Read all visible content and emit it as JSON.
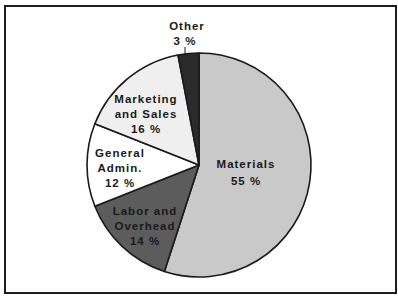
{
  "chart_data": {
    "type": "pie",
    "title": "",
    "start_angle": "12 o'clock, clockwise",
    "slices": [
      {
        "label": "Materials",
        "value": 55,
        "display": "55%",
        "color": "#c9c9c9"
      },
      {
        "label": "Labor and Overhead",
        "value": 14,
        "display": "14%",
        "color": "#5c5c5c"
      },
      {
        "label": "General Admin.",
        "value": 12,
        "display": "12%",
        "color": "#ffffff"
      },
      {
        "label": "Marketing and Sales",
        "value": 16,
        "display": "16%",
        "color": "#efefef"
      },
      {
        "label": "Other",
        "value": 3,
        "display": "3%",
        "color": "#2b2b2b"
      }
    ],
    "categories": [
      "Materials",
      "Labor and Overhead",
      "General Admin.",
      "Marketing and Sales",
      "Other"
    ],
    "values": [
      55,
      14,
      12,
      16,
      3
    ],
    "legend": "none (inline labels)"
  },
  "labels": {
    "materials": {
      "line1": "Materials",
      "pct": "55 %"
    },
    "labor": {
      "line1": "Labor and",
      "line2": "Overhead",
      "pct": "14 %"
    },
    "general": {
      "line1": "General",
      "line2": "Admin.",
      "pct": "12 %"
    },
    "marketing": {
      "line1": "Marketing",
      "line2": "and  Sales",
      "pct": "16 %"
    },
    "other": {
      "line1": "Other",
      "pct": "3 %"
    }
  }
}
